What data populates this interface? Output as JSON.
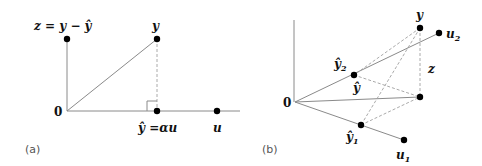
{
  "panels": [
    {
      "id": "a",
      "caption": "(a)",
      "labels": {
        "origin": "0",
        "z_label": "z = y − ŷ",
        "y_label": "y",
        "yhat_label": "ŷ =αu",
        "u_label": "u"
      }
    },
    {
      "id": "b",
      "caption": "(b)",
      "labels": {
        "origin": "0",
        "y_label": "y",
        "u2_main": "u",
        "u2_sub": "2",
        "u1_main": "u",
        "u1_sub": "1",
        "yhat2_main": "ŷ",
        "yhat2_sub": "2",
        "yhat1_main": "ŷ",
        "yhat1_sub": "1",
        "yhat_label": "ŷ",
        "z_label": "z"
      }
    }
  ]
}
